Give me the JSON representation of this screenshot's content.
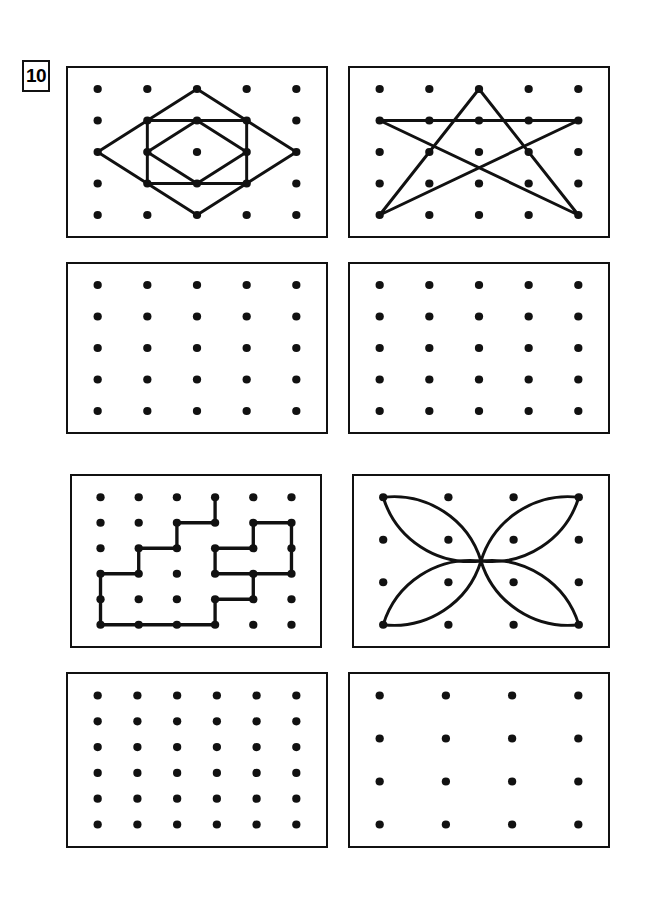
{
  "worksheet": {
    "exercise_number": "10",
    "ink_color": "#111111",
    "background_color": "#ffffff",
    "panel_border_color": "#111111"
  },
  "panels": [
    {
      "id": "panel-1",
      "name": "nested-squares-diamond-figure",
      "position": {
        "x": 66,
        "y": 66,
        "width": 262,
        "height": 172
      },
      "grid": {
        "cols": 5,
        "rows": 5,
        "dot_radius": 4.2
      },
      "figure_present": true,
      "figure_type": "nested-squares",
      "stroke_width": 3.0,
      "shapes": [
        {
          "name": "outer-diamond",
          "kind": "polygon",
          "points": [
            [
              2,
              0
            ],
            [
              4,
              2
            ],
            [
              2,
              4
            ],
            [
              0,
              2
            ]
          ]
        },
        {
          "name": "axis-aligned-square",
          "kind": "polygon",
          "points": [
            [
              1,
              1
            ],
            [
              3,
              1
            ],
            [
              3,
              3
            ],
            [
              1,
              3
            ]
          ]
        },
        {
          "name": "inner-diamond",
          "kind": "polygon",
          "points": [
            [
              2,
              1
            ],
            [
              3,
              2
            ],
            [
              2,
              3
            ],
            [
              1,
              2
            ]
          ]
        }
      ]
    },
    {
      "id": "panel-2",
      "name": "five-point-star-figure",
      "position": {
        "x": 348,
        "y": 66,
        "width": 262,
        "height": 172
      },
      "grid": {
        "cols": 5,
        "rows": 5,
        "dot_radius": 4.2
      },
      "figure_present": true,
      "figure_type": "pentagram-star",
      "stroke_width": 3.0,
      "shapes": [
        {
          "name": "star-outline",
          "kind": "polygon",
          "points": [
            [
              2,
              0
            ],
            [
              4,
              4
            ],
            [
              0,
              1
            ],
            [
              4,
              1
            ],
            [
              0,
              4
            ]
          ]
        }
      ]
    },
    {
      "id": "panel-3",
      "name": "blank-grid-5x5-left",
      "position": {
        "x": 66,
        "y": 262,
        "width": 262,
        "height": 172
      },
      "grid": {
        "cols": 5,
        "rows": 5,
        "dot_radius": 4.2
      },
      "figure_present": false,
      "figure_type": "blank",
      "stroke_width": 3.0,
      "shapes": []
    },
    {
      "id": "panel-4",
      "name": "blank-grid-5x5-right",
      "position": {
        "x": 348,
        "y": 262,
        "width": 262,
        "height": 172
      },
      "grid": {
        "cols": 5,
        "rows": 5,
        "dot_radius": 4.2
      },
      "figure_present": false,
      "figure_type": "blank",
      "stroke_width": 3.0,
      "shapes": []
    },
    {
      "id": "panel-5",
      "name": "staircase-zigzag-figure",
      "position": {
        "x": 70,
        "y": 474,
        "width": 252,
        "height": 174
      },
      "grid": {
        "cols": 6,
        "rows": 6,
        "dot_radius": 4.2
      },
      "figure_present": true,
      "figure_type": "orthogonal-staircase",
      "stroke_width": 3.4,
      "shapes": [
        {
          "name": "staircase-path",
          "kind": "polyline",
          "points": [
            [
              3,
              0
            ],
            [
              3,
              1
            ],
            [
              2,
              1
            ],
            [
              2,
              2
            ],
            [
              1,
              2
            ],
            [
              1,
              3
            ],
            [
              0,
              3
            ],
            [
              0,
              5
            ],
            [
              3,
              5
            ],
            [
              3,
              4
            ],
            [
              4,
              4
            ],
            [
              4,
              3
            ],
            [
              3,
              3
            ],
            [
              3,
              2
            ],
            [
              4,
              2
            ],
            [
              4,
              1
            ],
            [
              5,
              1
            ],
            [
              5,
              3
            ],
            [
              4,
              3
            ]
          ]
        }
      ]
    },
    {
      "id": "panel-6",
      "name": "four-petal-flower-figure",
      "position": {
        "x": 352,
        "y": 474,
        "width": 258,
        "height": 174
      },
      "grid": {
        "cols": 4,
        "rows": 4,
        "dot_radius": 4.2
      },
      "figure_present": true,
      "figure_type": "four-petal-flower",
      "stroke_width": 3.0,
      "shapes": [
        {
          "name": "petal-top-left",
          "kind": "petal",
          "tip": [
            0,
            0
          ]
        },
        {
          "name": "petal-top-right",
          "kind": "petal",
          "tip": [
            3,
            0
          ]
        },
        {
          "name": "petal-bottom-right",
          "kind": "petal",
          "tip": [
            3,
            3
          ]
        },
        {
          "name": "petal-bottom-left",
          "kind": "petal",
          "tip": [
            0,
            3
          ]
        }
      ]
    },
    {
      "id": "panel-7",
      "name": "blank-grid-6x6-left",
      "position": {
        "x": 66,
        "y": 672,
        "width": 262,
        "height": 176
      },
      "grid": {
        "cols": 6,
        "rows": 6,
        "dot_radius": 4.2
      },
      "figure_present": false,
      "figure_type": "blank",
      "stroke_width": 3.0,
      "shapes": []
    },
    {
      "id": "panel-8",
      "name": "blank-grid-4x4-right",
      "position": {
        "x": 348,
        "y": 672,
        "width": 262,
        "height": 176
      },
      "grid": {
        "cols": 4,
        "rows": 4,
        "dot_radius": 4.2
      },
      "figure_present": false,
      "figure_type": "blank",
      "stroke_width": 3.0,
      "shapes": []
    }
  ]
}
